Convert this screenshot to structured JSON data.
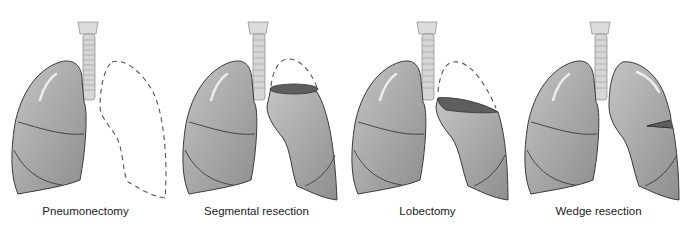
{
  "colors": {
    "lung_fill": "#a9a9a9",
    "lung_stroke": "#3a3a3a",
    "resection_fill": "#5e5e5e",
    "trachea": "#d8d8d8",
    "dashed": "#555555"
  },
  "panels": [
    {
      "caption": "Pneumonectomy",
      "procedure": "pneumonectomy"
    },
    {
      "caption": "Segmental resection",
      "procedure": "segmental"
    },
    {
      "caption": "Lobectomy",
      "procedure": "lobectomy"
    },
    {
      "caption": "Wedge resection",
      "procedure": "wedge"
    }
  ]
}
